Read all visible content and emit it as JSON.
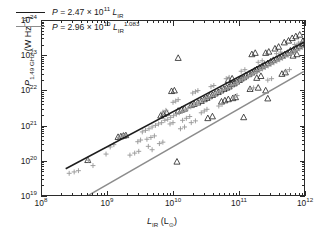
{
  "chart_data": {
    "type": "scatter",
    "title": "",
    "subtitle": "",
    "xlabel": "L_IR (L_sun)",
    "ylabel": "P_1.49 GHz (W Hz^-1)",
    "xscale": "log",
    "yscale": "log",
    "xlim": [
      100000000.0,
      1000000000000.0
    ],
    "ylim": [
      1e+19,
      1e+24
    ],
    "grid": false,
    "legend_position": "upper-left-inside",
    "axis": {
      "x_tick_labels": [
        "10^8",
        "10^9",
        "10^10",
        "10^11",
        "10^12"
      ],
      "x_tick_mantissa": [
        "10",
        "10",
        "10",
        "10",
        "10"
      ],
      "x_tick_exponents": [
        "8",
        "9",
        "10",
        "11",
        "12"
      ],
      "y_tick_labels": [
        "10^19",
        "10^20",
        "10^21",
        "10^22",
        "10^23",
        "10^24"
      ],
      "y_tick_mantissa": [
        "10",
        "10",
        "10",
        "10",
        "10",
        "10"
      ],
      "y_tick_exponents": [
        "19",
        "20",
        "21",
        "22",
        "23",
        "24"
      ],
      "minor_ticks": true,
      "tick_direction": "in",
      "frame": "box"
    },
    "axis_titles": {
      "x": {
        "symbol": "L",
        "sub": "IR",
        "unit_open": "(L",
        "unit_sym": "⊙",
        "unit_close": ")"
      },
      "y": {
        "symbol": "P",
        "sub": "1.49 GHz",
        "unit": "(W Hz",
        "unit_exp": "−1",
        "unit_close": ")"
      }
    },
    "legend": [
      {
        "name": "linear-fit",
        "color": "#1d1d1d",
        "text_plain": "P = 2.47 x 10^11 L_IR",
        "symbol": "P",
        "equals": "=",
        "coefficient": "2.47",
        "times": "×",
        "base": "10",
        "base_exponent": "11",
        "variable": "L",
        "variable_sub": "IR",
        "variable_exponent": ""
      },
      {
        "name": "power-law-fit",
        "color": "#8c8c8c",
        "text_plain": "P = 2.96 x 10^10 L_IR^1.083",
        "symbol": "P",
        "equals": "=",
        "coefficient": "2.96",
        "times": "×",
        "base": "10",
        "base_exponent": "10",
        "variable": "L",
        "variable_sub": "IR",
        "variable_exponent": "1.083"
      }
    ],
    "fits": [
      {
        "name": "linear-fit",
        "color": "#1d1d1d",
        "coefficient": 247000000000.0,
        "slope": 1.0,
        "x_start": 230000000.0,
        "x_end": 1000000000000.0
      },
      {
        "name": "power-law-fit",
        "color": "#8c8c8c",
        "coefficient": 29600000000.0,
        "slope": 1.083,
        "x_start": 230000000.0,
        "x_end": 1000000000000.0
      }
    ],
    "series": [
      {
        "name": "triangles",
        "marker": "triangle-open",
        "color": "#2b2b2b",
        "points": [
          [
            1450000000.0,
            4.6e+20
          ],
          [
            1600000000.0,
            4.8e+20
          ],
          [
            1750000000.0,
            5e+20
          ],
          [
            1900000000.0,
            5.2e+20
          ],
          [
            500000000.0,
            1e+20
          ],
          [
            6500000000.0,
            1.9e+21
          ],
          [
            7200000000.0,
            2.1e+21
          ],
          [
            8000000000.0,
            2.3e+21
          ],
          [
            9500000000.0,
            9.6e+21
          ],
          [
            10500000000.0,
            1e+22
          ],
          [
            11500000000.0,
            9e+19
          ],
          [
            12000000000.0,
            2.6e+21
          ],
          [
            13500000000.0,
            2.8e+21
          ],
          [
            15000000000.0,
            3e+21
          ],
          [
            12000000000.0,
            8.6e+22
          ],
          [
            19000000000.0,
            3.8e+21
          ],
          [
            21000000000.0,
            4.1e+21
          ],
          [
            24000000000.0,
            4.5e+21
          ],
          [
            27000000000.0,
            5e+21
          ],
          [
            30000000000.0,
            5.6e+21
          ],
          [
            33000000000.0,
            6.1e+21
          ],
          [
            36000000000.0,
            6.8e+21
          ],
          [
            40000000000.0,
            7.4e+21
          ],
          [
            44000000000.0,
            8.2e+21
          ],
          [
            49000000000.0,
            9e+21
          ],
          [
            54000000000.0,
            1e+22
          ],
          [
            60000000000.0,
            1.1e+22
          ],
          [
            66000000000.0,
            1.2e+22
          ],
          [
            72000000000.0,
            1.3e+22
          ],
          [
            79000000000.0,
            1.5e+22
          ],
          [
            86000000000.0,
            1.6e+22
          ],
          [
            94000000000.0,
            1.8e+22
          ],
          [
            103000000000.0,
            2e+22
          ],
          [
            55000000000.0,
            4.8e+21
          ],
          [
            62000000000.0,
            5.2e+21
          ],
          [
            70000000000.0,
            5.6e+21
          ],
          [
            82000000000.0,
            6e+21
          ],
          [
            90000000000.0,
            6.4e+21
          ],
          [
            110000000000.0,
            2.2e+22
          ],
          [
            120000000000.0,
            2.4e+22
          ],
          [
            130000000000.0,
            2.7e+22
          ],
          [
            145000000000.0,
            3e+22
          ],
          [
            160000000000.0,
            3.3e+22
          ],
          [
            175000000000.0,
            3.7e+22
          ],
          [
            190000000000.0,
            4.1e+22
          ],
          [
            210000000000.0,
            4.5e+22
          ],
          [
            230000000000.0,
            5e+22
          ],
          [
            250000000000.0,
            5.5e+22
          ],
          [
            280000000000.0,
            6.1e+22
          ],
          [
            310000000000.0,
            6.8e+22
          ],
          [
            340000000000.0,
            7.5e+22
          ],
          [
            380000000000.0,
            8.3e+22
          ],
          [
            420000000000.0,
            9.2e+22
          ],
          [
            460000000000.0,
            1e+23
          ],
          [
            510000000000.0,
            1.1e+23
          ],
          [
            560000000000.0,
            1.2e+23
          ],
          [
            620000000000.0,
            1.4e+23
          ],
          [
            690000000000.0,
            1.5e+23
          ],
          [
            760000000000.0,
            1.7e+23
          ],
          [
            840000000000.0,
            1.9e+23
          ],
          [
            930000000000.0,
            2.1e+23
          ],
          [
            160000000000.0,
            1.1e+23
          ],
          [
            180000000000.0,
            1.2e+23
          ],
          [
            260000000000.0,
            1.2e+23
          ],
          [
            290000000000.0,
            1.3e+23
          ],
          [
            360000000000.0,
            1.6e+23
          ],
          [
            410000000000.0,
            1.8e+23
          ],
          [
            500000000000.0,
            2.4e+23
          ],
          [
            580000000000.0,
            2.7e+23
          ],
          [
            660000000000.0,
            3.2e+23
          ],
          [
            750000000000.0,
            3.6e+23
          ],
          [
            860000000000.0,
            4e+23
          ],
          [
            150000000000.0,
            1.1e+22
          ],
          [
            200000000000.0,
            1.2e+22
          ],
          [
            260000000000.0,
            1e+22
          ],
          [
            280000000000.0,
            5.9e+21
          ],
          [
            120000000000.0,
            1.7e+21
          ],
          [
            190000000000.0,
            2.3e+22
          ],
          [
            220000000000.0,
            2.6e+22
          ],
          [
            70000000000.0,
            2e+22
          ],
          [
            80000000000.0,
            2.2e+22
          ],
          [
            34000000000.0,
            1.6e+21
          ],
          [
            40000000000.0,
            1.8e+21
          ],
          [
            460000000000.0,
            3e+22
          ],
          [
            520000000000.0,
            3.3e+22
          ],
          [
            680000000000.0,
            1e+23
          ],
          [
            780000000000.0,
            1.1e+23
          ],
          [
            960000000000.0,
            2.6e+23
          ],
          [
            990000000000.0,
            2.2e+23
          ]
        ]
      },
      {
        "name": "plus-markers",
        "marker": "plus",
        "color": "#9a9a9a",
        "points": [
          [
            260000000.0,
            4.2e+19
          ],
          [
            310000000.0,
            4.6e+19
          ],
          [
            360000000.0,
            5e+19
          ],
          [
            510000000.0,
            1e+20
          ],
          [
            600000000.0,
            7e+19
          ],
          [
            950000000.0,
            1.5e+20
          ],
          [
            1100000000.0,
            2.4e+20
          ],
          [
            1250000000.0,
            2.8e+20
          ],
          [
            1500000000.0,
            4.5e+20
          ],
          [
            1700000000.0,
            4.9e+20
          ],
          [
            1900000000.0,
            5.4e+20
          ],
          [
            2200000000.0,
            1.4e+20
          ],
          [
            2600000000.0,
            1.6e+20
          ],
          [
            3000000000.0,
            1.8e+20
          ],
          [
            3400000000.0,
            6.5e+20
          ],
          [
            3800000000.0,
            7.2e+20
          ],
          [
            4300000000.0,
            8e+20
          ],
          [
            4800000000.0,
            9e+20
          ],
          [
            5400000000.0,
            1e+21
          ],
          [
            6000000000.0,
            1.1e+21
          ],
          [
            6700000000.0,
            1.2e+21
          ],
          [
            7500000000.0,
            1.4e+21
          ],
          [
            8300000000.0,
            1.5e+21
          ],
          [
            9200000000.0,
            1.7e+21
          ],
          [
            10200000000.0,
            1.9e+21
          ],
          [
            11300000000.0,
            2.1e+21
          ],
          [
            12500000000.0,
            2.3e+21
          ],
          [
            13800000000.0,
            2.5e+21
          ],
          [
            15300000000.0,
            2.8e+21
          ],
          [
            16900000000.0,
            3.1e+21
          ],
          [
            18700000000.0,
            3.4e+21
          ],
          [
            20700000000.0,
            3.8e+21
          ],
          [
            22900000000.0,
            4.2e+21
          ],
          [
            25300000000.0,
            4.6e+21
          ],
          [
            28000000000.0,
            5.1e+21
          ],
          [
            31000000000.0,
            5.6e+21
          ],
          [
            34300000000.0,
            6.2e+21
          ],
          [
            37900000000.0,
            6.8e+21
          ],
          [
            41900000000.0,
            7.5e+21
          ],
          [
            46400000000.0,
            8.3e+21
          ],
          [
            51300000000.0,
            9.2e+21
          ],
          [
            56700000000.0,
            1e+22
          ],
          [
            62700000000.0,
            1.1e+22
          ],
          [
            69400000000.0,
            1.2e+22
          ],
          [
            76700000000.0,
            1.4e+22
          ],
          [
            84900000000.0,
            1.5e+22
          ],
          [
            93900000000.0,
            1.7e+22
          ],
          [
            104000000000.0,
            1.9e+22
          ],
          [
            115000000000.0,
            2.1e+22
          ],
          [
            127000000000.0,
            2.3e+22
          ],
          [
            140000000000.0,
            2.5e+22
          ],
          [
            155000000000.0,
            2.8e+22
          ],
          [
            172000000000.0,
            3.1e+22
          ],
          [
            190000000000.0,
            3.4e+22
          ],
          [
            210000000000.0,
            3.8e+22
          ],
          [
            232000000000.0,
            4.2e+22
          ],
          [
            257000000000.0,
            4.6e+22
          ],
          [
            284000000000.0,
            5.1e+22
          ],
          [
            314000000000.0,
            5.7e+22
          ],
          [
            348000000000.0,
            6.3e+22
          ],
          [
            385000000000.0,
            7e+22
          ],
          [
            426000000000.0,
            7.7e+22
          ],
          [
            471000000000.0,
            8.5e+22
          ],
          [
            521000000000.0,
            9.5e+22
          ],
          [
            576000000000.0,
            1.05e+23
          ],
          [
            638000000000.0,
            1.16e+23
          ],
          [
            705000000000.0,
            1.29e+23
          ],
          [
            780000000000.0,
            1.42e+23
          ],
          [
            863000000000.0,
            1.57e+23
          ],
          [
            955000000000.0,
            1.74e+23
          ],
          [
            4000000000.0,
            4e+20
          ],
          [
            4600000000.0,
            4.5e+20
          ],
          [
            5200000000.0,
            5e+20
          ],
          [
            7000000000.0,
            2.4e+21
          ],
          [
            7800000000.0,
            2.7e+21
          ],
          [
            10000000000.0,
            4.6e+21
          ],
          [
            11000000000.0,
            5e+21
          ],
          [
            12000000000.0,
            5.5e+21
          ],
          [
            14000000000.0,
            1.4e+21
          ],
          [
            16000000000.0,
            1.6e+21
          ],
          [
            18000000000.0,
            1.8e+21
          ],
          [
            20000000000.0,
            8.5e+21
          ],
          [
            22000000000.0,
            9.3e+21
          ],
          [
            24000000000.0,
            1e+22
          ],
          [
            27000000000.0,
            2.3e+21
          ],
          [
            30000000000.0,
            2.6e+21
          ],
          [
            33000000000.0,
            2.9e+21
          ],
          [
            38000000000.0,
            1.3e+22
          ],
          [
            42000000000.0,
            1.4e+22
          ],
          [
            50000000000.0,
            3.6e+21
          ],
          [
            56000000000.0,
            4e+21
          ],
          [
            65000000000.0,
            2.2e+22
          ],
          [
            72000000000.0,
            2.4e+22
          ],
          [
            85000000000.0,
            6.5e+21
          ],
          [
            95000000000.0,
            7.2e+21
          ],
          [
            110000000000.0,
            3.6e+22
          ],
          [
            125000000000.0,
            4e+22
          ],
          [
            150000000000.0,
            1.1e+22
          ],
          [
            170000000000.0,
            1.2e+22
          ],
          [
            200000000000.0,
            6.5e+22
          ],
          [
            230000000000.0,
            7.2e+22
          ],
          [
            280000000000.0,
            2e+22
          ],
          [
            320000000000.0,
            2.2e+22
          ],
          [
            380000000000.0,
            1.15e+23
          ],
          [
            440000000000.0,
            1.28e+23
          ],
          [
            530000000000.0,
            3.6e+22
          ],
          [
            600000000000.0,
            4e+22
          ],
          [
            720000000000.0,
            2.1e+23
          ],
          [
            820000000000.0,
            2.3e+23
          ],
          [
            930000000000.0,
            2.5e+23
          ],
          [
            6200000000.0,
            3e+20
          ],
          [
            7000000000.0,
            3.3e+20
          ],
          [
            2900000000.0,
            3.4e+20
          ],
          [
            3200000000.0,
            3.8e+20
          ],
          [
            9000000000.0,
            1.1e+21
          ],
          [
            10000000000.0,
            1.2e+21
          ],
          [
            13000000000.0,
            8e+20
          ],
          [
            15000000000.0,
            9e+20
          ],
          [
            4200000000.0,
            2.5e+20
          ],
          [
            4800000000.0,
            2e+20
          ],
          [
            19000000000.0,
            1.2e+21
          ],
          [
            22000000000.0,
            1.35e+21
          ]
        ]
      }
    ]
  }
}
